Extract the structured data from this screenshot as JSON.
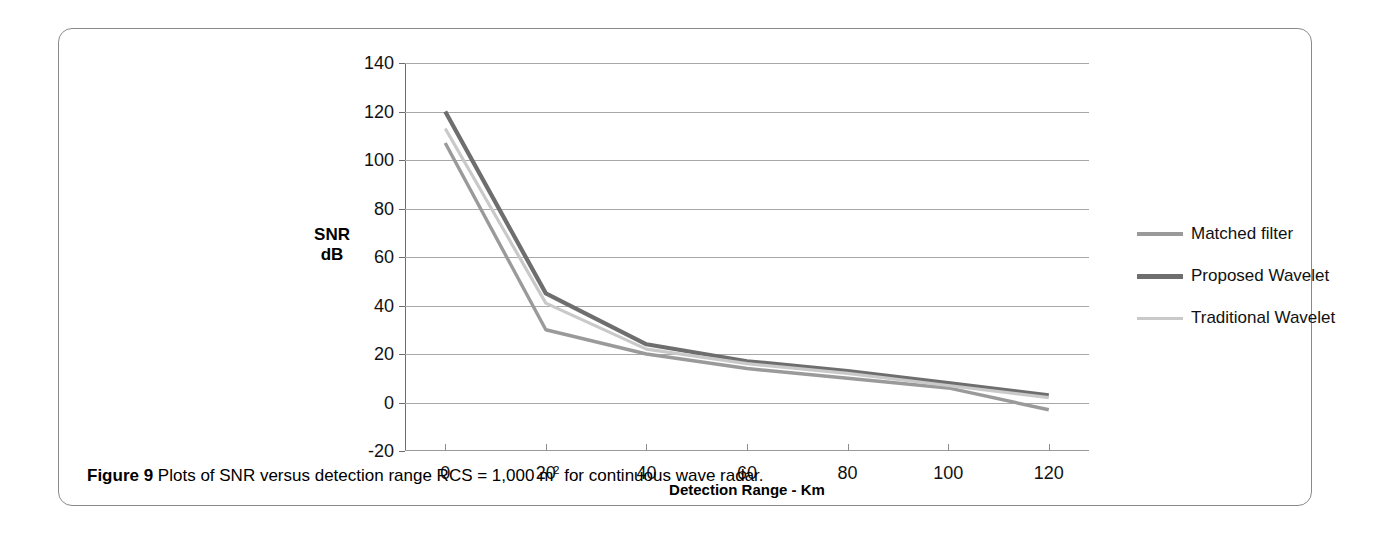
{
  "figure": {
    "caption_bold": "Figure 9",
    "caption_text": "Plots of SNR versus detection range RCS = 1,000 m",
    "caption_superscript": "2",
    "caption_tail": " for continuous wave radar."
  },
  "chart_data": {
    "type": "line",
    "title": "",
    "subtitle": "",
    "xlabel": "Detection Range - Km",
    "ylabel": "SNR dB",
    "ylabel_line1": "SNR",
    "ylabel_line2": "dB",
    "x": [
      0,
      20,
      40,
      60,
      80,
      100,
      120
    ],
    "xlim": [
      -8,
      128
    ],
    "ylim": [
      -20,
      140
    ],
    "xticks": [
      "0",
      "20",
      "40",
      "60",
      "80",
      "100",
      "120"
    ],
    "yticks": [
      "-20",
      "0",
      "20",
      "40",
      "60",
      "80",
      "100",
      "120",
      "140"
    ],
    "grid": true,
    "grid_axis": "y",
    "legend_position": "inside-upper-right",
    "series": [
      {
        "name": "Matched filter",
        "color": "#9a9a9a",
        "width": 3.4,
        "values": [
          107,
          30,
          20,
          14,
          10,
          6,
          -3
        ]
      },
      {
        "name": "Proposed Wavelet",
        "color": "#6e6e6e",
        "width": 4.2,
        "values": [
          120,
          45,
          24,
          17,
          13,
          8,
          3
        ]
      },
      {
        "name": "Traditional Wavelet",
        "color": "#c9c9c9",
        "width": 3.2,
        "values": [
          113,
          41,
          22,
          16,
          12,
          7,
          2
        ]
      }
    ]
  }
}
